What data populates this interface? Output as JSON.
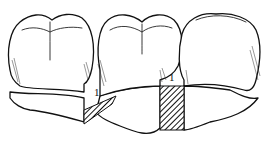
{
  "figure": {
    "labels": [
      {
        "id": "space-left",
        "text": "1"
      },
      {
        "id": "space-right",
        "text": "1"
      }
    ],
    "colors": {
      "ink": "#111111",
      "background": "#ffffff"
    }
  }
}
